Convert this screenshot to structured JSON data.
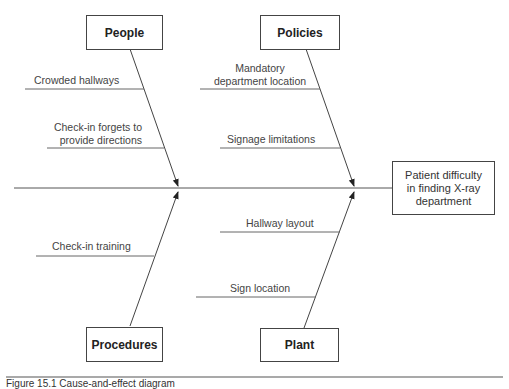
{
  "diagram": {
    "type": "fishbone",
    "effect": "Patient difficulty in finding X-ray department",
    "effect_lines": [
      "Patient difficulty",
      "in finding X-ray",
      "department"
    ],
    "categories": [
      {
        "name": "People",
        "position": "top-left",
        "causes": [
          "Crowded hallways",
          "Check-in forgets to provide directions"
        ],
        "cause_lines": [
          [
            "Crowded hallways"
          ],
          [
            "Check-in forgets to",
            "provide directions"
          ]
        ]
      },
      {
        "name": "Policies",
        "position": "top-right",
        "causes": [
          "Mandatory department location",
          "Signage limitations"
        ],
        "cause_lines": [
          [
            "Mandatory",
            "department location"
          ],
          [
            "Signage limitations"
          ]
        ]
      },
      {
        "name": "Procedures",
        "position": "bottom-left",
        "causes": [
          "Check-in training"
        ],
        "cause_lines": [
          [
            "Check-in training"
          ]
        ]
      },
      {
        "name": "Plant",
        "position": "bottom-right",
        "causes": [
          "Hallway layout",
          "Sign location"
        ],
        "cause_lines": [
          [
            "Hallway layout"
          ],
          [
            "Sign location"
          ]
        ]
      }
    ]
  },
  "caption": "Figure 15.1  Cause-and-effect diagram"
}
